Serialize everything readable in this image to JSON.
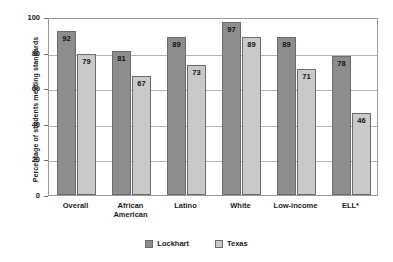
{
  "chart_data": {
    "type": "bar",
    "title": "",
    "subtitle": "",
    "xlabel": "",
    "ylabel": "Percentage of students meeting standards",
    "ylim": [
      0,
      100
    ],
    "yticks": [
      0,
      20,
      40,
      60,
      80,
      100
    ],
    "grid": true,
    "legend_position": "bottom",
    "categories": [
      "Overall",
      "African American",
      "Latino",
      "White",
      "Low-income",
      "ELL*"
    ],
    "category_lines": [
      [
        "Overall"
      ],
      [
        "African",
        "American"
      ],
      [
        "Latino"
      ],
      [
        "White"
      ],
      [
        "Low-income"
      ],
      [
        "ELL*"
      ]
    ],
    "series": [
      {
        "name": "Lockhart",
        "color": "#8d8d8d",
        "values": [
          92,
          81,
          89,
          97,
          89,
          78
        ]
      },
      {
        "name": "Texas",
        "color": "#c9c9c9",
        "values": [
          79,
          67,
          73,
          89,
          71,
          46
        ]
      }
    ]
  },
  "colors": {
    "series_lockhart": "#8d8d8d",
    "series_texas": "#c9c9c9",
    "bar_border": "#6b6b6b",
    "gridline": "#b4b4b4",
    "frame": "#9a9a9a",
    "text": "#1a1a1a",
    "background": "#ffffff"
  }
}
